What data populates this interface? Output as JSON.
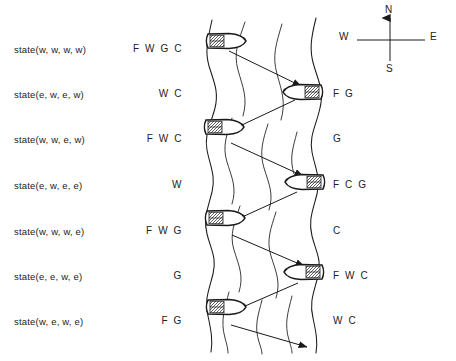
{
  "diagram": {
    "ink_color": "#1a1a1a",
    "background": "#ffffff",
    "rows": [
      {
        "state": "state(w, w, w, w)",
        "west_bank": "F W G C",
        "east_bank": ""
      },
      {
        "state": "state(e, w, e, w)",
        "west_bank": "W C",
        "east_bank": "F G"
      },
      {
        "state": "state(w, w, e, w)",
        "west_bank": "F W C",
        "east_bank": "G"
      },
      {
        "state": "state(e, w, e, e)",
        "west_bank": "W",
        "east_bank": "F C G"
      },
      {
        "state": "state(w, w, w, e)",
        "west_bank": "F W G",
        "east_bank": "C"
      },
      {
        "state": "state(e, e, w, e)",
        "west_bank": "G",
        "east_bank": "F W C"
      },
      {
        "state": "state(w, e, w, e)",
        "west_bank": "F G",
        "east_bank": "W C"
      }
    ],
    "boats": [
      {
        "bank": "west",
        "row": 0
      },
      {
        "bank": "east",
        "row": 1
      },
      {
        "bank": "west",
        "row": 2
      },
      {
        "bank": "east",
        "row": 3
      },
      {
        "bank": "west",
        "row": 4
      },
      {
        "bank": "east",
        "row": 5
      },
      {
        "bank": "west",
        "row": 6
      }
    ],
    "crossings": [
      {
        "from_row": 0,
        "to_row": 1,
        "direction": "west-to-east"
      },
      {
        "from_row": 1,
        "to_row": 2,
        "direction": "east-to-west"
      },
      {
        "from_row": 2,
        "to_row": 3,
        "direction": "west-to-east"
      },
      {
        "from_row": 3,
        "to_row": 4,
        "direction": "east-to-west"
      },
      {
        "from_row": 4,
        "to_row": 5,
        "direction": "west-to-east"
      },
      {
        "from_row": 5,
        "to_row": 6,
        "direction": "east-to-west"
      },
      {
        "from_row": 6,
        "to_row": 7,
        "direction": "west-to-east"
      }
    ],
    "compass": {
      "north": "N",
      "south": "S",
      "west": "W",
      "east": "E"
    }
  }
}
